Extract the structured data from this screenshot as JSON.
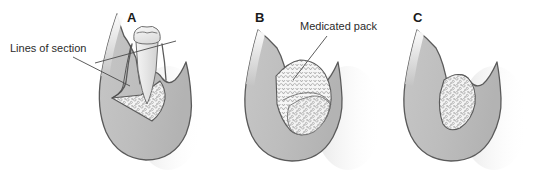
{
  "figure": {
    "width": 533,
    "height": 178,
    "background_color": "#ffffff"
  },
  "colors": {
    "background": "#ffffff",
    "gingiva_fill": "#bdbdbd",
    "gingiva_fill_light": "#cfcfcf",
    "bone_cavity_fill": "#f2f2f2",
    "tooth_fill": "#e8e8e8",
    "tooth_crown_fill": "#efefef",
    "outline_stroke": "#5a5a5a",
    "leader_stroke": "#4a4a4a",
    "text": "#2b2b2b",
    "panel_letter": "#1a1a1a",
    "granule_stroke": "#8a8a8a",
    "shadow": "#d8d8d8"
  },
  "panels": [
    {
      "id": "panel-a",
      "letter": "A",
      "letter_x": 127,
      "letter_y": 22,
      "description": "Tooth in socket with intrabony defect; incision lines marked",
      "callout": {
        "id": "lines-of-section",
        "label": "Lines of section",
        "text_x": 10,
        "text_y": 52,
        "leaders": [
          {
            "x1": 73,
            "y1": 57,
            "x2": 130,
            "y2": 86
          },
          {
            "x1": 95,
            "y1": 63,
            "x2": 176,
            "y2": 41
          }
        ]
      }
    },
    {
      "id": "panel-b",
      "letter": "B",
      "letter_x": 255,
      "letter_y": 22,
      "description": "Defect filled with medicated pack material",
      "callout": {
        "id": "medicated-pack",
        "label": "Medicated pack",
        "text_x": 300,
        "text_y": 30,
        "leaders": [
          {
            "x1": 327,
            "y1": 36,
            "x2": 293,
            "y2": 80
          }
        ]
      }
    },
    {
      "id": "panel-c",
      "letter": "C",
      "letter_x": 413,
      "letter_y": 22,
      "description": "Healed gingiva covering regenerated bone defect",
      "callout": null
    }
  ],
  "legend_notes": {
    "granular_region": "cancellous bone / graft granules",
    "scalloped_region": "medicated pack"
  }
}
